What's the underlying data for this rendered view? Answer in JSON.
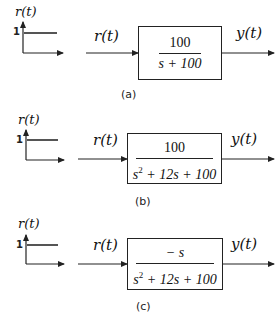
{
  "diagrams": [
    {
      "id": "a",
      "caption": "(a)",
      "step_label": "r(t)",
      "step_value": "1",
      "input_label": "r(t)",
      "output_label": "y(t)",
      "tf_numerator": "100",
      "tf_denominator": "s + 100"
    },
    {
      "id": "b",
      "caption": "(b)",
      "step_label": "r(t)",
      "step_value": "1",
      "input_label": "r(t)",
      "output_label": "y(t)",
      "tf_numerator": "100",
      "tf_denominator_s": "s",
      "tf_denominator_exp": "2",
      "tf_denominator_rest": " + 12s + 100"
    },
    {
      "id": "c",
      "caption": "(c)",
      "step_label": "r(t)",
      "step_value": "1",
      "input_label": "r(t)",
      "output_label": "y(t)",
      "tf_numerator": "− s",
      "tf_denominator_s": "s",
      "tf_denominator_exp": "2",
      "tf_denominator_rest": " + 12s + 100"
    }
  ],
  "colors": {
    "line": "#222222",
    "step": "#555555",
    "background": "#ffffff"
  }
}
